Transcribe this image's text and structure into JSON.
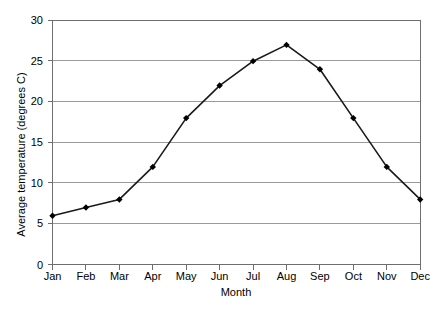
{
  "chart_data": {
    "type": "line",
    "title": "",
    "subtitle": "",
    "xlabel": "Month",
    "ylabel": "Average temperature (degrees C)",
    "categories": [
      "Jan",
      "Feb",
      "Mar",
      "Apr",
      "May",
      "Jun",
      "Jul",
      "Aug",
      "Sep",
      "Oct",
      "Nov",
      "Dec"
    ],
    "values": [
      6,
      7,
      8,
      12,
      18,
      22,
      25,
      27,
      24,
      18,
      12,
      8
    ],
    "series": [
      {
        "name": "Average temperature",
        "values": [
          6,
          7,
          8,
          12,
          18,
          22,
          25,
          27,
          24,
          18,
          12,
          8
        ]
      }
    ],
    "ylim": [
      0,
      30
    ],
    "y_ticks": [
      0,
      5,
      10,
      15,
      20,
      25,
      30
    ],
    "y_tick_labels": [
      "0",
      "5",
      "10",
      "15",
      "20",
      "25",
      "30"
    ],
    "x_tick_labels": [
      "Jan",
      "Feb",
      "Mar",
      "Apr",
      "May",
      "Jun",
      "Jul",
      "Aug",
      "Sep",
      "Oct",
      "Nov",
      "Dec"
    ],
    "grid": true,
    "grid_axis": "y",
    "legend": false,
    "legend_position": "none",
    "marker": "diamond",
    "colors": {
      "line": "#1a1a1a",
      "marker": "#000000",
      "grid": "#9a9a9a",
      "axis": "#6e6e6e",
      "background": "#ffffff",
      "text": "#231f20"
    }
  }
}
